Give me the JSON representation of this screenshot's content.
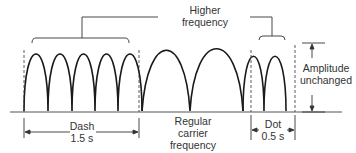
{
  "diagram": {
    "type": "FSK Morse code waveform",
    "labels": {
      "higher_frequency": [
        "Higher",
        "frequency"
      ],
      "amplitude": [
        "Amplitude",
        "unchanged"
      ],
      "carrier": [
        "Regular",
        "carrier",
        "frequency"
      ],
      "dash": [
        "Dash",
        "1.5 s"
      ],
      "dot": [
        "Dot",
        "0.5 s"
      ]
    },
    "segments": [
      {
        "name": "dash",
        "cycles": 5,
        "duration": "1.5 s",
        "frequency": "higher"
      },
      {
        "name": "carrier",
        "cycles": 2,
        "frequency": "regular"
      },
      {
        "name": "dot",
        "cycles": 2,
        "duration": "0.5 s",
        "frequency": "higher"
      }
    ],
    "colors": {
      "line": "#1a1a1a",
      "text": "#333333"
    }
  }
}
